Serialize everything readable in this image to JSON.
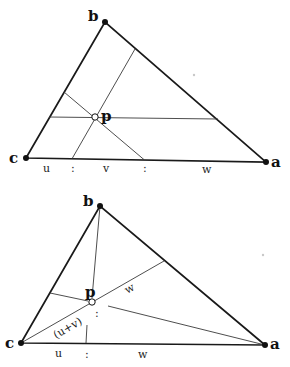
{
  "diagrams": [
    {
      "id": "parallel-lines",
      "vertices": {
        "b": {
          "label": "b",
          "x": 105,
          "y": 22
        },
        "c": {
          "label": "c",
          "x": 26,
          "y": 158
        },
        "a": {
          "label": "a",
          "x": 266,
          "y": 162
        }
      },
      "point_p": {
        "label": "p",
        "x": 95,
        "y": 117
      },
      "base_labels": [
        "u",
        ":",
        "v",
        ":",
        "w"
      ]
    },
    {
      "id": "cevians",
      "vertices": {
        "b": {
          "label": "b",
          "x": 100,
          "y": 206
        },
        "c": {
          "label": "c",
          "x": 21,
          "y": 343
        },
        "a": {
          "label": "a",
          "x": 265,
          "y": 345
        }
      },
      "point_p": {
        "label": "p",
        "x": 92,
        "y": 302
      },
      "segment_labels": {
        "upper": "w",
        "lower": "(u+v)",
        "colon": ":"
      },
      "base_labels": [
        "u",
        ":",
        "w"
      ]
    }
  ],
  "colors": {
    "line": "#1a1a1a",
    "background": "#ffffff"
  }
}
